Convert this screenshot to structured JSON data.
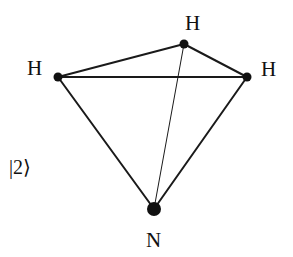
{
  "diagram": {
    "state_label": "|2⟩",
    "atoms": [
      {
        "id": "h_left",
        "label": "H",
        "x": 58,
        "y": 77,
        "r": 4.5
      },
      {
        "id": "h_top",
        "label": "H",
        "x": 184,
        "y": 44,
        "r": 4.5
      },
      {
        "id": "h_right",
        "label": "H",
        "x": 247,
        "y": 77,
        "r": 4.5
      },
      {
        "id": "n",
        "label": "N",
        "x": 154,
        "y": 209,
        "r": 7
      }
    ],
    "bonds": [
      {
        "from": "h_left",
        "to": "h_top",
        "weight": "thick"
      },
      {
        "from": "h_top",
        "to": "h_right",
        "weight": "thick"
      },
      {
        "from": "h_left",
        "to": "h_right",
        "weight": "thick"
      },
      {
        "from": "h_left",
        "to": "n",
        "weight": "thick"
      },
      {
        "from": "h_right",
        "to": "n",
        "weight": "thick"
      },
      {
        "from": "h_top",
        "to": "n",
        "weight": "thin"
      }
    ],
    "colors": {
      "line": "#1a1a1a",
      "atom": "#111111",
      "background": "#ffffff"
    }
  }
}
